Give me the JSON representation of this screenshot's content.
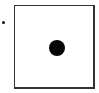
{
  "widget": {
    "type": "radio-option",
    "bullet": "•",
    "box": {
      "border_color": "#333333",
      "fill": "#ffffff"
    },
    "dot": {
      "color": "#050505",
      "selected": true
    },
    "label": ""
  }
}
